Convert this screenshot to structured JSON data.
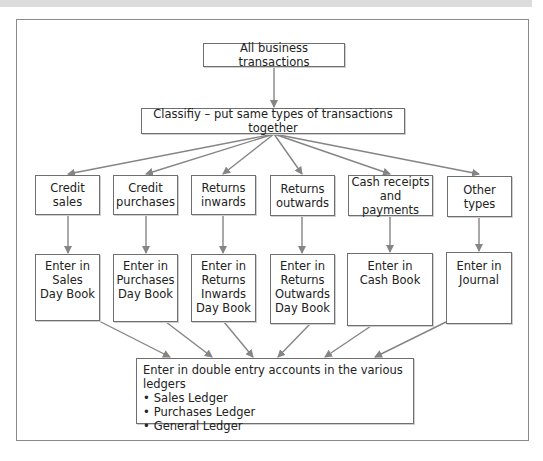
{
  "diagram": {
    "root": "All business transactions",
    "classify": "Classifiy – put same types of transactions together",
    "categories": [
      {
        "label": "Credit sales",
        "book": "Enter in Sales Day Book"
      },
      {
        "label": "Credit purchases",
        "book": "Enter in Purchases Day Book"
      },
      {
        "label": "Returns inwards",
        "book": "Enter in Returns Inwards Day Book"
      },
      {
        "label": "Returns outwards",
        "book": "Enter in Returns Outwards Day Book"
      },
      {
        "label": "Cash receipts and payments",
        "book": "Enter in Cash Book"
      },
      {
        "label": "Other types",
        "book": "Enter in Journal"
      }
    ],
    "ledger": {
      "heading": "Enter in double entry accounts in the various ledgers",
      "items": [
        "Sales Ledger",
        "Purchases Ledger",
        "General Ledger"
      ]
    },
    "colors": {
      "line": "#858585",
      "border": "#6f6f6f",
      "band": "#dcdcdc"
    }
  }
}
